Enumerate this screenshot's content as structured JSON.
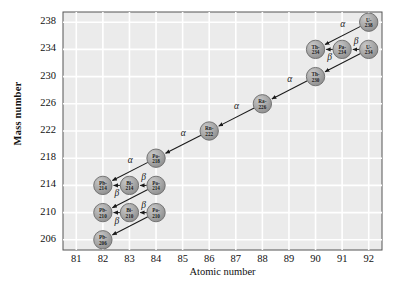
{
  "chart_data": {
    "type": "scatter",
    "title": "",
    "xlabel": "Atomic number",
    "ylabel": "Mass number",
    "xlim": [
      80.5,
      92.5
    ],
    "ylim": [
      204.5,
      239.5
    ],
    "xticks": [
      81,
      82,
      83,
      84,
      85,
      86,
      87,
      88,
      89,
      90,
      91,
      92
    ],
    "yticks": [
      206,
      210,
      214,
      218,
      222,
      226,
      230,
      234,
      238
    ],
    "grid": true,
    "legend": "none",
    "nodes": [
      {
        "id": "U-238",
        "element": "U",
        "mass": 238,
        "z": 92,
        "a": 238,
        "line1": "U-",
        "line2": "238"
      },
      {
        "id": "Th-234",
        "element": "Th",
        "mass": 234,
        "z": 90,
        "a": 234,
        "line1": "Th-",
        "line2": "234"
      },
      {
        "id": "Pa-234",
        "element": "Pa",
        "mass": 234,
        "z": 91,
        "a": 234,
        "line1": "Pa-",
        "line2": "234"
      },
      {
        "id": "U-234",
        "element": "U",
        "mass": 234,
        "z": 92,
        "a": 234,
        "line1": "U-",
        "line2": "234"
      },
      {
        "id": "Th-230",
        "element": "Th",
        "mass": 230,
        "z": 90,
        "a": 230,
        "line1": "Th-",
        "line2": "230"
      },
      {
        "id": "Ra-226",
        "element": "Ra",
        "mass": 226,
        "z": 88,
        "a": 226,
        "line1": "Ra-",
        "line2": "226"
      },
      {
        "id": "Rn-222",
        "element": "Rn",
        "mass": 222,
        "z": 86,
        "a": 222,
        "line1": "Rn-",
        "line2": "222"
      },
      {
        "id": "Po-218",
        "element": "Po",
        "mass": 218,
        "z": 84,
        "a": 218,
        "line1": "Po-",
        "line2": "218"
      },
      {
        "id": "Pb-214",
        "element": "Pb",
        "mass": 214,
        "z": 82,
        "a": 214,
        "line1": "Pb-",
        "line2": "214"
      },
      {
        "id": "Bi-214",
        "element": "Bi",
        "mass": 214,
        "z": 83,
        "a": 214,
        "line1": "Bi-",
        "line2": "214"
      },
      {
        "id": "Po-214",
        "element": "Po",
        "mass": 214,
        "z": 84,
        "a": 214,
        "line1": "Po-",
        "line2": "214"
      },
      {
        "id": "Pb-210",
        "element": "Pb",
        "mass": 210,
        "z": 82,
        "a": 210,
        "line1": "Pb-",
        "line2": "210"
      },
      {
        "id": "Bi-210",
        "element": "Bi",
        "mass": 210,
        "z": 83,
        "a": 210,
        "line1": "Bi-",
        "line2": "210"
      },
      {
        "id": "Po-210",
        "element": "Po",
        "mass": 210,
        "z": 84,
        "a": 210,
        "line1": "Po-",
        "line2": "210"
      },
      {
        "id": "Pb-206",
        "element": "Pb",
        "mass": 206,
        "z": 82,
        "a": 206,
        "line1": "Pb-",
        "line2": "206"
      }
    ],
    "transitions": [
      {
        "from": "U-238",
        "to": "Th-234",
        "type": "alpha",
        "label": "α",
        "label_side": "above"
      },
      {
        "from": "U-234",
        "to": "Pa-234",
        "type": "beta",
        "label": "β",
        "label_side": "above"
      },
      {
        "from": "Pa-234",
        "to": "Th-234",
        "type": "beta",
        "label": "β",
        "label_side": "below"
      },
      {
        "from": "U-234",
        "to": "Th-230",
        "type": "alpha",
        "label": "α",
        "label_side": "above"
      },
      {
        "from": "Th-230",
        "to": "Ra-226",
        "type": "alpha",
        "label": "α",
        "label_side": "above"
      },
      {
        "from": "Ra-226",
        "to": "Rn-222",
        "type": "alpha",
        "label": "α",
        "label_side": "above"
      },
      {
        "from": "Rn-222",
        "to": "Po-218",
        "type": "alpha",
        "label": "α",
        "label_side": "above"
      },
      {
        "from": "Po-218",
        "to": "Pb-214",
        "type": "alpha",
        "label": "α",
        "label_side": "above"
      },
      {
        "from": "Po-214",
        "to": "Bi-214",
        "type": "beta",
        "label": "β",
        "label_side": "above"
      },
      {
        "from": "Bi-214",
        "to": "Pb-214",
        "type": "beta",
        "label": "β",
        "label_side": "below"
      },
      {
        "from": "Po-214",
        "to": "Pb-210",
        "type": "alpha",
        "label": "α",
        "label_side": "above"
      },
      {
        "from": "Po-210",
        "to": "Bi-210",
        "type": "beta",
        "label": "β",
        "label_side": "above"
      },
      {
        "from": "Bi-210",
        "to": "Pb-210",
        "type": "beta",
        "label": "β",
        "label_side": "below"
      },
      {
        "from": "Po-210",
        "to": "Pb-206",
        "type": "alpha",
        "label": "α",
        "label_side": "above"
      }
    ],
    "colors": {
      "plot_background": "#ebebeb",
      "gridline": "#ffffff",
      "node_fill": "#a6a6a6",
      "node_stroke": "#6b6b6b",
      "arrow": "#1a1a1a",
      "axis": "#333333",
      "text": "#111111"
    }
  }
}
